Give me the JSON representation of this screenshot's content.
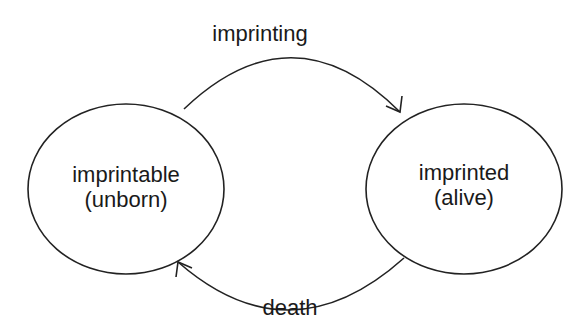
{
  "diagram": {
    "type": "state-transition",
    "nodes": [
      {
        "id": "imprintable",
        "line1": "imprintable",
        "line2": "(unborn)"
      },
      {
        "id": "imprinted",
        "line1": "imprinted",
        "line2": "(alive)"
      }
    ],
    "edges": [
      {
        "from": "imprintable",
        "to": "imprinted",
        "label": "imprinting"
      },
      {
        "from": "imprinted",
        "to": "imprintable",
        "label": "death"
      }
    ],
    "stroke_color": "#222222"
  }
}
